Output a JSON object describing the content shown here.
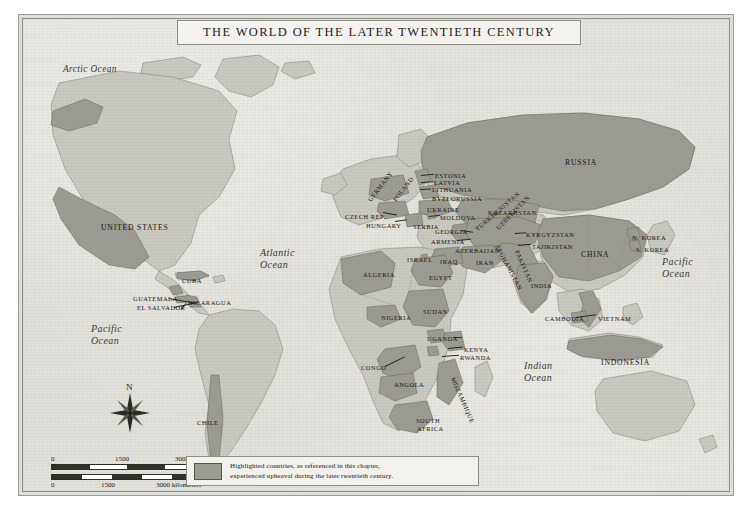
{
  "title": "THE WORLD OF THE LATER TWENTIETH CENTURY",
  "colors": {
    "highlight": "#9b9b93",
    "land": "#c9c8c1",
    "ocean": "#e3e2dd",
    "frame": "#8e8e88",
    "ink": "#16150f"
  },
  "legend": {
    "line1": "Highlighted countries, as referenced in this chapter,",
    "line2": "experienced upheaval during the later twentieth century.",
    "swatch_label": "highlighted-country-swatch"
  },
  "scale": {
    "miles": {
      "ticks": [
        "0",
        "1500",
        "3000 miles"
      ]
    },
    "kilometers": {
      "ticks": [
        "0",
        "1500",
        "3000 kilometers"
      ]
    }
  },
  "compass": {
    "north_label": "N"
  },
  "oceans": [
    {
      "name": "Arctic Ocean",
      "lines": [
        "Arctic Ocean"
      ],
      "x": 40,
      "y": 44,
      "size": "sm"
    },
    {
      "name": "Atlantic Ocean",
      "lines": [
        "Atlantic",
        "Ocean"
      ],
      "x": 237,
      "y": 228,
      "size": ""
    },
    {
      "name": "Pacific Ocean W",
      "lines": [
        "Pacific",
        "Ocean"
      ],
      "x": 68,
      "y": 304,
      "size": ""
    },
    {
      "name": "Pacific Ocean E",
      "lines": [
        "Pacific",
        "Ocean"
      ],
      "x": 639,
      "y": 237,
      "size": ""
    },
    {
      "name": "Indian Ocean",
      "lines": [
        "Indian",
        "Ocean"
      ],
      "x": 501,
      "y": 341,
      "size": ""
    }
  ],
  "countries": [
    {
      "label": "UNITED STATES",
      "x": 78,
      "y": 204,
      "class": "mid",
      "rot": 0
    },
    {
      "label": "CUBA",
      "x": 159,
      "y": 258,
      "class": "",
      "rot": 0
    },
    {
      "label": "GUATEMALA",
      "x": 110,
      "y": 276,
      "class": "",
      "rot": 0
    },
    {
      "label": "EL SALVADOR",
      "x": 114,
      "y": 285,
      "class": "",
      "rot": 0
    },
    {
      "label": "NICARAGUA",
      "x": 165,
      "y": 280,
      "class": "",
      "rot": 0
    },
    {
      "label": "CHILE",
      "x": 174,
      "y": 400,
      "class": "",
      "rot": 0
    },
    {
      "label": "GERMANY",
      "x": 346,
      "y": 178,
      "class": "",
      "rot": -52
    },
    {
      "label": "POLAND",
      "x": 371,
      "y": 178,
      "class": "",
      "rot": -52
    },
    {
      "label": "CZECH REP.",
      "x": 322,
      "y": 194,
      "class": "",
      "rot": 0
    },
    {
      "label": "HUNGARY",
      "x": 343,
      "y": 203,
      "class": "",
      "rot": 0
    },
    {
      "label": "SERBIA",
      "x": 390,
      "y": 204,
      "class": "",
      "rot": 0
    },
    {
      "label": "ESTONIA",
      "x": 412,
      "y": 153,
      "class": "",
      "rot": 0
    },
    {
      "label": "LATVIA",
      "x": 411,
      "y": 160,
      "class": "",
      "rot": 0
    },
    {
      "label": "LITHUANIA",
      "x": 409,
      "y": 167,
      "class": "",
      "rot": 0
    },
    {
      "label": "BYELORUSSIA",
      "x": 409,
      "y": 176,
      "class": "",
      "rot": 0
    },
    {
      "label": "UKRAINE",
      "x": 404,
      "y": 187,
      "class": "",
      "rot": 0
    },
    {
      "label": "MOLDOVA",
      "x": 417,
      "y": 195,
      "class": "",
      "rot": 0
    },
    {
      "label": "RUSSIA",
      "x": 542,
      "y": 139,
      "class": "mid",
      "rot": 0
    },
    {
      "label": "KAZAKHSTAN",
      "x": 465,
      "y": 190,
      "class": "",
      "rot": 0
    },
    {
      "label": "GEORGIA",
      "x": 412,
      "y": 209,
      "class": "",
      "rot": 0
    },
    {
      "label": "ARMENIA",
      "x": 408,
      "y": 219,
      "class": "",
      "rot": 0
    },
    {
      "label": "AZERBAIJAN",
      "x": 432,
      "y": 228,
      "class": "",
      "rot": 0
    },
    {
      "label": "TURKMENISTAN",
      "x": 453,
      "y": 207,
      "class": "",
      "rot": -41
    },
    {
      "label": "UZBEKISTAN",
      "x": 474,
      "y": 206,
      "class": "",
      "rot": -46
    },
    {
      "label": "KYRGYZSTAN",
      "x": 503,
      "y": 212,
      "class": "",
      "rot": 0
    },
    {
      "label": "TAJIKISTAN",
      "x": 509,
      "y": 224,
      "class": "",
      "rot": 0
    },
    {
      "label": "AFGHANISTAN",
      "x": 474,
      "y": 222,
      "class": "",
      "rot": 62
    },
    {
      "label": "PAKISTAN",
      "x": 494,
      "y": 228,
      "class": "",
      "rot": 66
    },
    {
      "label": "ISRAEL",
      "x": 384,
      "y": 237,
      "class": "",
      "rot": 0
    },
    {
      "label": "IRAQ",
      "x": 417,
      "y": 239,
      "class": "",
      "rot": 0
    },
    {
      "label": "IRAN",
      "x": 453,
      "y": 240,
      "class": "",
      "rot": 0
    },
    {
      "label": "INDIA",
      "x": 508,
      "y": 263,
      "class": "",
      "rot": 0
    },
    {
      "label": "CHINA",
      "x": 558,
      "y": 231,
      "class": "mid",
      "rot": 0
    },
    {
      "label": "N. KOREA",
      "x": 609,
      "y": 215,
      "class": "",
      "rot": 0
    },
    {
      "label": "S. KOREA",
      "x": 613,
      "y": 227,
      "class": "",
      "rot": 0
    },
    {
      "label": "CAMBODIA",
      "x": 522,
      "y": 296,
      "class": "",
      "rot": 0
    },
    {
      "label": "VIETNAM",
      "x": 575,
      "y": 296,
      "class": "",
      "rot": 0
    },
    {
      "label": "INDONESIA",
      "x": 578,
      "y": 339,
      "class": "mid",
      "rot": 0
    },
    {
      "label": "ALGERIA",
      "x": 340,
      "y": 252,
      "class": "",
      "rot": 0
    },
    {
      "label": "EGYPT",
      "x": 406,
      "y": 255,
      "class": "",
      "rot": 0
    },
    {
      "label": "NIGERIA",
      "x": 358,
      "y": 295,
      "class": "",
      "rot": 0
    },
    {
      "label": "SUDAN",
      "x": 400,
      "y": 289,
      "class": "",
      "rot": 0
    },
    {
      "label": "UGANDA",
      "x": 404,
      "y": 316,
      "class": "",
      "rot": 0
    },
    {
      "label": "KENYA",
      "x": 441,
      "y": 327,
      "class": "",
      "rot": 0
    },
    {
      "label": "RWANDA",
      "x": 437,
      "y": 335,
      "class": "",
      "rot": 0
    },
    {
      "label": "CONGO",
      "x": 338,
      "y": 345,
      "class": "",
      "rot": 0
    },
    {
      "label": "ANGOLA",
      "x": 371,
      "y": 362,
      "class": "",
      "rot": 0
    },
    {
      "label": "MOZAMBIQUE",
      "x": 430,
      "y": 355,
      "class": "",
      "rot": 66
    },
    {
      "label": "SOUTH",
      "x": 393,
      "y": 398,
      "class": "",
      "rot": 0
    },
    {
      "label": "AFRICA",
      "x": 394,
      "y": 406,
      "class": "",
      "rot": 0
    }
  ],
  "leaders": [
    {
      "name": "guatemala-leader",
      "x": 146,
      "y": 279,
      "len": 27,
      "angle": 10
    },
    {
      "name": "elsalvador-leader",
      "x": 151,
      "y": 288,
      "len": 25,
      "angle": -12
    },
    {
      "name": "nicaragua-leader",
      "x": 163,
      "y": 284,
      "len": 8,
      "angle": 130
    },
    {
      "name": "estonia-leader",
      "x": 398,
      "y": 156,
      "len": 13,
      "angle": -6
    },
    {
      "name": "latvia-leader",
      "x": 398,
      "y": 163,
      "len": 12,
      "angle": -4
    },
    {
      "name": "lithuania-leader",
      "x": 397,
      "y": 170,
      "len": 11,
      "angle": -3
    },
    {
      "name": "moldova-leader",
      "x": 406,
      "y": 197,
      "len": 11,
      "angle": -6
    },
    {
      "name": "czech-leader",
      "x": 360,
      "y": 193,
      "len": 14,
      "angle": 10
    },
    {
      "name": "hungary-leader",
      "x": 372,
      "y": 202,
      "len": 12,
      "angle": -8
    },
    {
      "name": "georgia-leader",
      "x": 438,
      "y": 211,
      "len": 12,
      "angle": 8
    },
    {
      "name": "armenia-leader",
      "x": 435,
      "y": 221,
      "len": 13,
      "angle": -6
    },
    {
      "name": "kyrgyz-leader",
      "x": 492,
      "y": 214,
      "len": 11,
      "angle": -4
    },
    {
      "name": "tajik-leader",
      "x": 495,
      "y": 226,
      "len": 13,
      "angle": -5
    },
    {
      "name": "kenya-leader",
      "x": 425,
      "y": 329,
      "len": 15,
      "angle": -6
    },
    {
      "name": "rwanda-leader",
      "x": 419,
      "y": 337,
      "len": 17,
      "angle": -4
    },
    {
      "name": "congo-leader",
      "x": 362,
      "y": 347,
      "len": 22,
      "angle": -26
    },
    {
      "name": "cambodia-leader",
      "x": 553,
      "y": 298,
      "len": 20,
      "angle": -8
    },
    {
      "name": "uganda-leader",
      "x": 430,
      "y": 318,
      "len": 9,
      "angle": 0
    }
  ]
}
